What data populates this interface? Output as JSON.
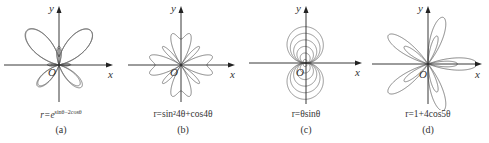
{
  "figure": {
    "panels": [
      {
        "id": "a",
        "caption": "(a)",
        "formula_lhs": "r=",
        "formula_base": "e",
        "formula_sup": "sinθ−2cosθ",
        "formula_text": "r=e^(sinθ−2cosθ)",
        "x_label": "x",
        "y_label": "y",
        "origin_label": "O"
      },
      {
        "id": "b",
        "caption": "(b)",
        "formula_text": "r=sin²4θ+cos4θ",
        "x_label": "x",
        "y_label": "y",
        "origin_label": "O"
      },
      {
        "id": "c",
        "caption": "(c)",
        "formula_text": "r=θsinθ",
        "x_label": "x",
        "y_label": "y",
        "origin_label": "O"
      },
      {
        "id": "d",
        "caption": "(d)",
        "formula_text": "r=1+4cos5θ",
        "x_label": "x",
        "y_label": "y",
        "origin_label": "O"
      }
    ],
    "colors": {
      "curve": "#555555",
      "axis": "#222222",
      "text": "#333333"
    }
  }
}
